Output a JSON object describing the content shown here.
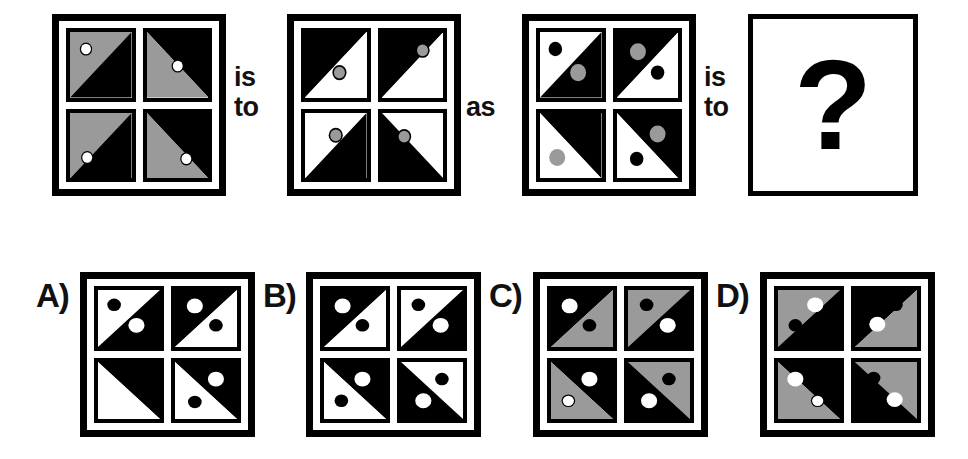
{
  "puzzle": {
    "type": "visual-analogy",
    "connector_1": {
      "line1": "is",
      "line2": "to"
    },
    "connector_2": {
      "line1": "as"
    },
    "connector_3": {
      "line1": "is",
      "line2": "to"
    },
    "question_mark": "?",
    "colors": {
      "black": "#000000",
      "white": "#ffffff",
      "gray": "#9a9a9a",
      "ring": "#000000"
    },
    "legend": {
      "diag_note": "diag values: 'tl-br' = diagonal from top-left to bottom-right; 'bl-tr' = diagonal from bottom-left to top-right",
      "half_note": "fill_a is the half above/left of the diagonal, fill_b is the half below/right"
    }
  },
  "stimulus": {
    "panels": [
      {
        "name": "panel-1",
        "label": "A-term",
        "cells": [
          {
            "diag": "tl-br",
            "fill_a": "gray",
            "fill_b": "black",
            "dots": [
              {
                "cx": 26,
                "cy": 26,
                "r": 8,
                "fill": "white",
                "ring": true,
                "ring_w": 4
              }
            ]
          },
          {
            "diag": "bl-tr",
            "fill_a": "black",
            "fill_b": "gray",
            "dots": [
              {
                "cx": 50,
                "cy": 52,
                "r": 8,
                "fill": "white",
                "ring": true,
                "ring_w": 4
              }
            ]
          },
          {
            "diag": "tl-br",
            "fill_a": "gray",
            "fill_b": "black",
            "dots": [
              {
                "cx": 28,
                "cy": 68,
                "r": 8,
                "fill": "white",
                "ring": true,
                "ring_w": 4
              }
            ]
          },
          {
            "diag": "bl-tr",
            "fill_a": "black",
            "fill_b": "gray",
            "dots": [
              {
                "cx": 64,
                "cy": 70,
                "r": 8,
                "fill": "white",
                "ring": true,
                "ring_w": 4
              }
            ]
          }
        ]
      },
      {
        "name": "panel-2",
        "label": "B-term",
        "cells": [
          {
            "diag": "tl-br",
            "fill_a": "black",
            "fill_b": "white",
            "dots": [
              {
                "cx": 56,
                "cy": 62,
                "r": 9,
                "fill": "gray",
                "ring": true,
                "ring_w": 5
              }
            ]
          },
          {
            "diag": "tl-br",
            "fill_a": "black",
            "fill_b": "white",
            "dots": [
              {
                "cx": 66,
                "cy": 28,
                "r": 9,
                "fill": "gray",
                "ring": true,
                "ring_w": 5
              }
            ]
          },
          {
            "diag": "tl-br",
            "fill_a": "white",
            "fill_b": "black",
            "dots": [
              {
                "cx": 50,
                "cy": 34,
                "r": 9,
                "fill": "gray",
                "ring": true,
                "ring_w": 5
              }
            ]
          },
          {
            "diag": "bl-tr",
            "fill_a": "white",
            "fill_b": "black",
            "dots": [
              {
                "cx": 36,
                "cy": 36,
                "r": 9,
                "fill": "gray",
                "ring": true,
                "ring_w": 5
              }
            ]
          }
        ]
      },
      {
        "name": "panel-3",
        "label": "C-term",
        "cells": [
          {
            "diag": "tl-br",
            "fill_a": "white",
            "fill_b": "black",
            "dots": [
              {
                "cx": 25,
                "cy": 26,
                "r": 9,
                "fill": "black",
                "ring": true,
                "ring_w": 4
              },
              {
                "cx": 62,
                "cy": 62,
                "r": 13,
                "fill": "gray",
                "ring": false,
                "ring_w": 0
              }
            ]
          },
          {
            "diag": "tl-br",
            "fill_a": "black",
            "fill_b": "white",
            "dots": [
              {
                "cx": 34,
                "cy": 30,
                "r": 13,
                "fill": "gray",
                "ring": false,
                "ring_w": 0
              },
              {
                "cx": 66,
                "cy": 62,
                "r": 9,
                "fill": "black",
                "ring": true,
                "ring_w": 4
              }
            ]
          },
          {
            "diag": "bl-tr",
            "fill_a": "black",
            "fill_b": "white",
            "dots": [
              {
                "cx": 62,
                "cy": 30,
                "r": 9,
                "fill": "black",
                "ring": true,
                "ring_w": 4
              },
              {
                "cx": 28,
                "cy": 68,
                "r": 13,
                "fill": "gray",
                "ring": false,
                "ring_w": 0
              }
            ]
          },
          {
            "diag": "bl-tr",
            "fill_a": "black",
            "fill_b": "white",
            "dots": [
              {
                "cx": 66,
                "cy": 32,
                "r": 13,
                "fill": "gray",
                "ring": false,
                "ring_w": 0
              },
              {
                "cx": 32,
                "cy": 70,
                "r": 9,
                "fill": "black",
                "ring": true,
                "ring_w": 4
              }
            ]
          }
        ]
      }
    ]
  },
  "options": [
    {
      "name": "option-a",
      "label": "A)",
      "cells": [
        {
          "diag": "tl-br",
          "fill_a": "white",
          "fill_b": "black",
          "dots": [
            {
              "cx": 26,
              "cy": 26,
              "r": 9,
              "fill": "black",
              "ring": true,
              "ring_w": 4
            },
            {
              "cx": 62,
              "cy": 62,
              "r": 13,
              "fill": "white",
              "ring": false,
              "ring_w": 0
            }
          ]
        },
        {
          "diag": "tl-br",
          "fill_a": "black",
          "fill_b": "white",
          "dots": [
            {
              "cx": 32,
              "cy": 28,
              "r": 13,
              "fill": "white",
              "ring": false,
              "ring_w": 0
            },
            {
              "cx": 66,
              "cy": 62,
              "r": 9,
              "fill": "black",
              "ring": true,
              "ring_w": 4
            }
          ]
        },
        {
          "diag": "bl-tr",
          "fill_a": "black",
          "fill_b": "white",
          "dots": [
            {
              "cx": 62,
              "cy": 30,
              "r": 9,
              "fill": "black",
              "ring": true,
              "ring_w": 4
            },
            {
              "cx": 28,
              "cy": 68,
              "r": 13,
              "fill": "white",
              "ring": false,
              "ring_w": 0
            }
          ]
        },
        {
          "diag": "bl-tr",
          "fill_a": "black",
          "fill_b": "white",
          "dots": [
            {
              "cx": 66,
              "cy": 30,
              "r": 13,
              "fill": "white",
              "ring": false,
              "ring_w": 0
            },
            {
              "cx": 32,
              "cy": 70,
              "r": 9,
              "fill": "black",
              "ring": true,
              "ring_w": 4
            }
          ]
        }
      ]
    },
    {
      "name": "option-b",
      "label": "B)",
      "cells": [
        {
          "diag": "tl-br",
          "fill_a": "black",
          "fill_b": "white",
          "dots": [
            {
              "cx": 30,
              "cy": 28,
              "r": 13,
              "fill": "white",
              "ring": false,
              "ring_w": 0
            },
            {
              "cx": 62,
              "cy": 62,
              "r": 9,
              "fill": "black",
              "ring": true,
              "ring_w": 4
            }
          ]
        },
        {
          "diag": "tl-br",
          "fill_a": "white",
          "fill_b": "black",
          "dots": [
            {
              "cx": 28,
              "cy": 26,
              "r": 9,
              "fill": "black",
              "ring": true,
              "ring_w": 4
            },
            {
              "cx": 64,
              "cy": 62,
              "r": 13,
              "fill": "white",
              "ring": false,
              "ring_w": 0
            }
          ]
        },
        {
          "diag": "bl-tr",
          "fill_a": "black",
          "fill_b": "white",
          "dots": [
            {
              "cx": 62,
              "cy": 30,
              "r": 13,
              "fill": "white",
              "ring": false,
              "ring_w": 0
            },
            {
              "cx": 28,
              "cy": 68,
              "r": 9,
              "fill": "black",
              "ring": true,
              "ring_w": 4
            }
          ]
        },
        {
          "diag": "bl-tr",
          "fill_a": "white",
          "fill_b": "black",
          "dots": [
            {
              "cx": 66,
              "cy": 30,
              "r": 9,
              "fill": "black",
              "ring": true,
              "ring_w": 4
            },
            {
              "cx": 36,
              "cy": 68,
              "r": 13,
              "fill": "white",
              "ring": false,
              "ring_w": 0
            }
          ]
        }
      ]
    },
    {
      "name": "option-c",
      "label": "C)",
      "cells": [
        {
          "diag": "tl-br",
          "fill_a": "black",
          "fill_b": "gray",
          "dots": [
            {
              "cx": 30,
              "cy": 28,
              "r": 13,
              "fill": "white",
              "ring": false,
              "ring_w": 0
            },
            {
              "cx": 62,
              "cy": 62,
              "r": 9,
              "fill": "black",
              "ring": true,
              "ring_w": 4
            }
          ]
        },
        {
          "diag": "tl-br",
          "fill_a": "gray",
          "fill_b": "black",
          "dots": [
            {
              "cx": 30,
              "cy": 26,
              "r": 9,
              "fill": "black",
              "ring": true,
              "ring_w": 4
            },
            {
              "cx": 64,
              "cy": 62,
              "r": 13,
              "fill": "white",
              "ring": false,
              "ring_w": 0
            }
          ]
        },
        {
          "diag": "bl-tr",
          "fill_a": "black",
          "fill_b": "gray",
          "dots": [
            {
              "cx": 62,
              "cy": 30,
              "r": 13,
              "fill": "white",
              "ring": false,
              "ring_w": 0
            },
            {
              "cx": 28,
              "cy": 68,
              "r": 9,
              "fill": "white",
              "ring": true,
              "ring_w": 4
            }
          ]
        },
        {
          "diag": "bl-tr",
          "fill_a": "gray",
          "fill_b": "black",
          "dots": [
            {
              "cx": 66,
              "cy": 30,
              "r": 9,
              "fill": "black",
              "ring": true,
              "ring_w": 4
            },
            {
              "cx": 34,
              "cy": 68,
              "r": 13,
              "fill": "white",
              "ring": false,
              "ring_w": 0
            }
          ]
        }
      ]
    },
    {
      "name": "option-d",
      "label": "D)",
      "cells": [
        {
          "diag": "tl-br",
          "fill_a": "gray",
          "fill_b": "black",
          "dots": [
            {
              "cx": 60,
              "cy": 26,
              "r": 13,
              "fill": "white",
              "ring": false,
              "ring_w": 0
            },
            {
              "cx": 28,
              "cy": 62,
              "r": 9,
              "fill": "black",
              "ring": true,
              "ring_w": 4
            }
          ]
        },
        {
          "diag": "tl-br",
          "fill_a": "black",
          "fill_b": "gray",
          "dots": [
            {
              "cx": 66,
              "cy": 26,
              "r": 9,
              "fill": "black",
              "ring": true,
              "ring_w": 4
            },
            {
              "cx": 36,
              "cy": 60,
              "r": 13,
              "fill": "white",
              "ring": false,
              "ring_w": 0
            }
          ]
        },
        {
          "diag": "bl-tr",
          "fill_a": "black",
          "fill_b": "gray",
          "dots": [
            {
              "cx": 28,
              "cy": 30,
              "r": 13,
              "fill": "white",
              "ring": false,
              "ring_w": 0
            },
            {
              "cx": 64,
              "cy": 68,
              "r": 9,
              "fill": "white",
              "ring": true,
              "ring_w": 4
            }
          ]
        },
        {
          "diag": "bl-tr",
          "fill_a": "gray",
          "fill_b": "black",
          "dots": [
            {
              "cx": 30,
              "cy": 28,
              "r": 9,
              "fill": "black",
              "ring": true,
              "ring_w": 4
            },
            {
              "cx": 64,
              "cy": 66,
              "r": 13,
              "fill": "white",
              "ring": false,
              "ring_w": 0
            }
          ]
        }
      ]
    }
  ]
}
